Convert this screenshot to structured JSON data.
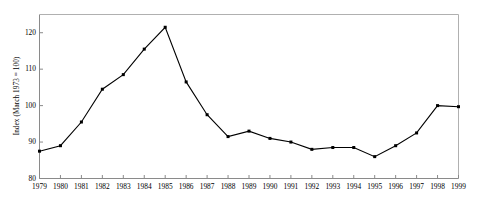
{
  "chart_data": {
    "type": "line",
    "title": "",
    "xlabel": "",
    "ylabel": "Index (March 1973 = 100)",
    "categories": [
      "1979",
      "1980",
      "1981",
      "1982",
      "1983",
      "1984",
      "1985",
      "1986",
      "1987",
      "1988",
      "1989",
      "1990",
      "1991",
      "1992",
      "1993",
      "1994",
      "1995",
      "1996",
      "1997",
      "1998",
      "1999"
    ],
    "values": [
      87.5,
      89.0,
      95.5,
      104.5,
      108.5,
      115.5,
      121.5,
      106.5,
      97.5,
      91.5,
      93.0,
      91.0,
      90.0,
      88.0,
      88.5,
      88.5,
      86.0,
      89.0,
      92.5,
      100.0,
      99.7
    ],
    "series": [
      {
        "name": "Index (March 1973 = 100)",
        "values": [
          87.5,
          89.0,
          95.5,
          104.5,
          108.5,
          115.5,
          121.5,
          106.5,
          97.5,
          91.5,
          93.0,
          91.0,
          90.0,
          88.0,
          88.5,
          88.5,
          86.0,
          89.0,
          92.5,
          100.0,
          99.7
        ]
      }
    ],
    "ylim": [
      80,
      125
    ],
    "yticks": [
      80,
      90,
      100,
      110,
      120
    ],
    "ytick_labels": [
      "80",
      "90",
      "100",
      "110",
      "120"
    ],
    "xlim": [
      1979,
      1999
    ],
    "grid": false,
    "legend": null,
    "marker": "filled-square",
    "line_color": "#000000",
    "marker_color": "#000000",
    "frame_color": "#808080",
    "background": "#ffffff"
  },
  "axis": {
    "y_title": "Index (March 1973 = 100)"
  }
}
